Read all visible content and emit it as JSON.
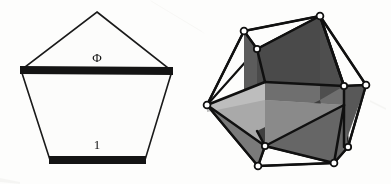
{
  "figure": {
    "background_color": "#fdfdfc",
    "ink_color": "#141414"
  },
  "pentagon": {
    "name": "regular-pentagon-golden-ratio",
    "diagonal_label": "Φ",
    "side_label": "1",
    "outline_color": "#1a1a1a",
    "bar_color": "#141414",
    "face_color": "#fcfcfb",
    "vertices": [
      {
        "name": "apex",
        "x": 97,
        "y": 12
      },
      {
        "name": "upper-right",
        "x": 172,
        "y": 71
      },
      {
        "name": "lower-right",
        "x": 145,
        "y": 160
      },
      {
        "name": "lower-left",
        "x": 50,
        "y": 160
      },
      {
        "name": "upper-left",
        "x": 21,
        "y": 70
      }
    ],
    "diagonal_bar": {
      "x1": 21,
      "y1": 70,
      "x2": 172,
      "y2": 71,
      "thickness": 7
    },
    "base_bar": {
      "x1": 50,
      "y1": 160,
      "x2": 145,
      "y2": 160,
      "thickness": 7
    }
  },
  "icosahedron": {
    "name": "icosahedron-with-three-golden-rectangles",
    "edge_color": "#101010",
    "vertex_fill": "#ffffff",
    "vertex_stroke": "#101010",
    "face_shades": {
      "dark": "#4e4e4e",
      "mid": "#6f6f6f",
      "light": "#a9a9a9",
      "lighter": "#bdbdbd",
      "darkest": "#3a3a3a"
    },
    "rectangles": [
      {
        "name": "golden-rectangle-vertical-dark",
        "shade": "dark"
      },
      {
        "name": "golden-rectangle-horizontal-light",
        "shade": "light"
      },
      {
        "name": "golden-rectangle-diagonal-mid",
        "shade": "mid"
      }
    ],
    "outer_vertices": [
      {
        "name": "v-top-right",
        "x": 320,
        "y": 16
      },
      {
        "name": "v-top-left",
        "x": 244,
        "y": 31
      },
      {
        "name": "v-upper-inner",
        "x": 257,
        "y": 49
      },
      {
        "name": "v-right-outer",
        "x": 366,
        "y": 85
      },
      {
        "name": "v-right-inner",
        "x": 344,
        "y": 86
      },
      {
        "name": "v-left-outer",
        "x": 207,
        "y": 105
      },
      {
        "name": "v-mid-left",
        "x": 265,
        "y": 146
      },
      {
        "name": "v-bottom-left",
        "x": 258,
        "y": 166
      },
      {
        "name": "v-bottom-right",
        "x": 334,
        "y": 163
      },
      {
        "name": "v-lower-right",
        "x": 348,
        "y": 147
      }
    ]
  }
}
